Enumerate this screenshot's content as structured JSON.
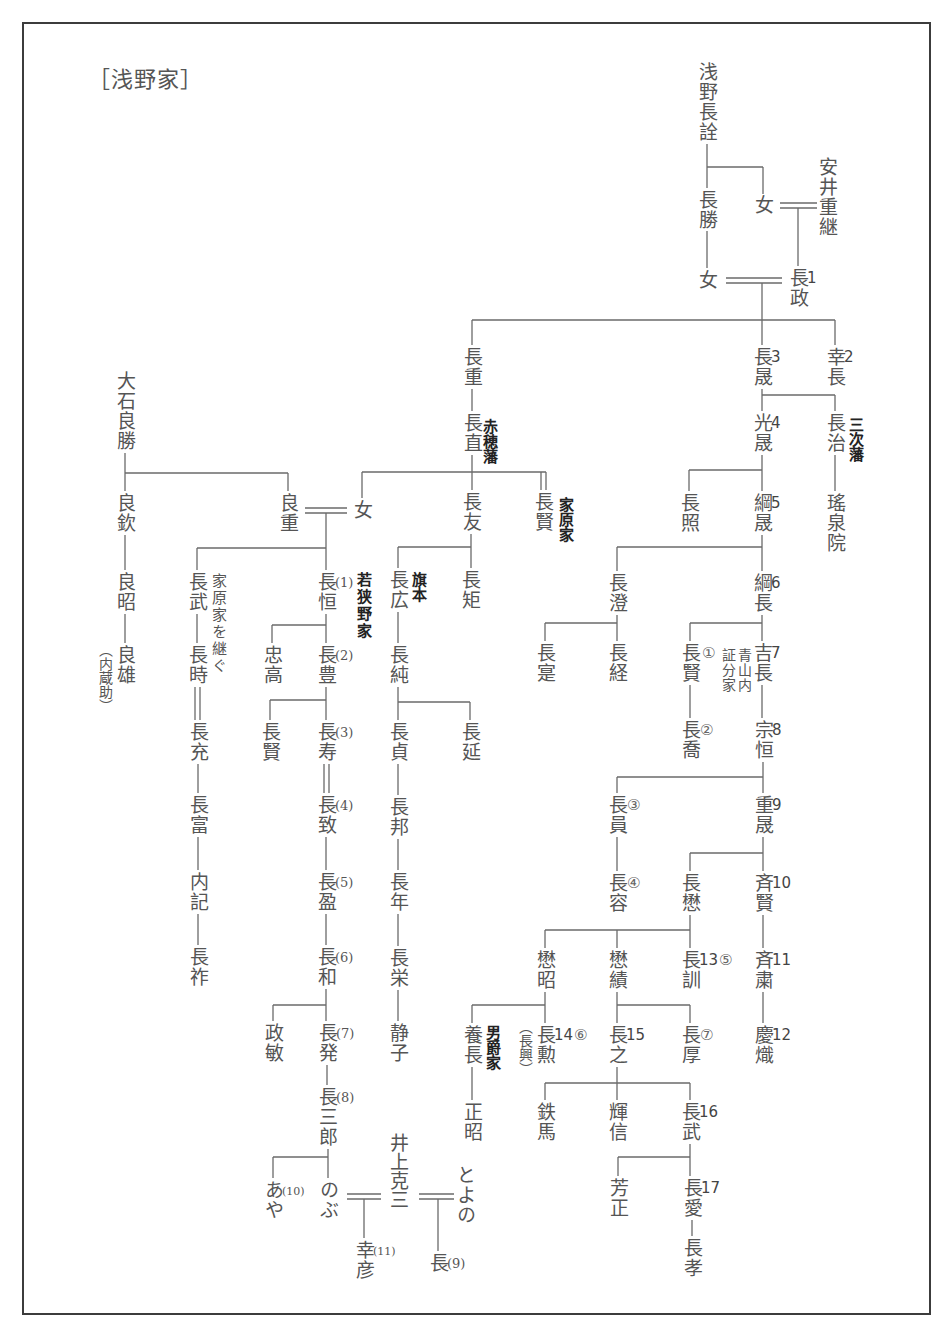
{
  "title": "［浅野家］",
  "persons": {
    "p01": {
      "name": "浅野長詮"
    },
    "p02": {
      "name": "長勝"
    },
    "p03": {
      "name": "女"
    },
    "p04": {
      "name": "安井重継"
    },
    "p05": {
      "name": "女"
    },
    "p06": {
      "name": "長政",
      "gen": "1"
    },
    "p07": {
      "name": "長晟",
      "gen": "3"
    },
    "p08": {
      "name": "幸長",
      "gen": "2"
    },
    "p09": {
      "name": "長重"
    },
    "p10": {
      "name": "長直",
      "note": "赤穂藩"
    },
    "p11": {
      "name": "光晟",
      "gen": "4"
    },
    "p12": {
      "name": "長治",
      "note": "三次藩"
    },
    "p13": {
      "name": "瑤泉院"
    },
    "p14": {
      "name": "長照"
    },
    "p15": {
      "name": "綱晟",
      "gen": "5"
    },
    "p16": {
      "name": "長澄"
    },
    "p17": {
      "name": "綱長",
      "gen": "6"
    },
    "p18": {
      "name": "長寔"
    },
    "p19": {
      "name": "長経"
    },
    "p20": {
      "name": "長賢",
      "branch": "①",
      "note": "青山内証分家"
    },
    "p21": {
      "name": "吉長",
      "gen": "7"
    },
    "p22": {
      "name": "長喬",
      "branch": "②"
    },
    "p23": {
      "name": "宗恒",
      "gen": "8"
    },
    "p24": {
      "name": "長員",
      "branch": "③"
    },
    "p25": {
      "name": "重晟",
      "gen": "9"
    },
    "p26": {
      "name": "長容",
      "branch": "④"
    },
    "p27": {
      "name": "長懋"
    },
    "p28": {
      "name": "斉賢",
      "gen": "10"
    },
    "p29": {
      "name": "懋昭"
    },
    "p30": {
      "name": "懋績"
    },
    "p31": {
      "name": "長訓",
      "gen": "13",
      "branch": "⑤"
    },
    "p32": {
      "name": "斉粛",
      "gen": "11"
    },
    "p33": {
      "name": "養長",
      "note": "男爵家"
    },
    "p34": {
      "name": "長勲",
      "gen": "14",
      "branch": "⑥",
      "alias": "（長興）"
    },
    "p35": {
      "name": "長之",
      "gen": "15"
    },
    "p36": {
      "name": "長厚",
      "branch": "⑦"
    },
    "p37": {
      "name": "慶熾",
      "gen": "12"
    },
    "p38": {
      "name": "正昭"
    },
    "p39": {
      "name": "鉄馬"
    },
    "p40": {
      "name": "輝信"
    },
    "p41": {
      "name": "長武",
      "gen": "16"
    },
    "p42": {
      "name": "芳正"
    },
    "p43": {
      "name": "長愛",
      "gen": "17"
    },
    "p44": {
      "name": "長孝"
    },
    "p45": {
      "name": "女"
    },
    "p46": {
      "name": "長友"
    },
    "p47": {
      "name": "長賢",
      "note": "家原家"
    },
    "p48": {
      "name": "長広",
      "note": "旗本"
    },
    "p49": {
      "name": "長矩"
    },
    "p50": {
      "name": "長純"
    },
    "p51": {
      "name": "長貞"
    },
    "p52": {
      "name": "長延"
    },
    "p53": {
      "name": "長邦"
    },
    "p54": {
      "name": "長年"
    },
    "p55": {
      "name": "長栄"
    },
    "p56": {
      "name": "静子"
    },
    "p57": {
      "name": "大石良勝"
    },
    "p58": {
      "name": "良欽"
    },
    "p59": {
      "name": "良重"
    },
    "p60": {
      "name": "良昭"
    },
    "p61": {
      "name": "良雄",
      "alias": "（内蔵助）"
    },
    "p62": {
      "name": "長武",
      "note": "家原家を継ぐ"
    },
    "p63": {
      "name": "長恒",
      "branch": "(1)",
      "note": "若狭野家"
    },
    "p64": {
      "name": "長時"
    },
    "p65": {
      "name": "忠高"
    },
    "p66": {
      "name": "長豊",
      "branch": "(2)"
    },
    "p67": {
      "name": "長充"
    },
    "p68": {
      "name": "長賢"
    },
    "p69": {
      "name": "長寿",
      "branch": "(3)"
    },
    "p70": {
      "name": "長富"
    },
    "p71": {
      "name": "長致",
      "branch": "(4)"
    },
    "p72": {
      "name": "内記"
    },
    "p73": {
      "name": "長盈",
      "branch": "(5)"
    },
    "p74": {
      "name": "長祚"
    },
    "p75": {
      "name": "長和",
      "branch": "(6)"
    },
    "p76": {
      "name": "政敏"
    },
    "p77": {
      "name": "長発",
      "branch": "(7)"
    },
    "p78": {
      "name": "長三郎",
      "branch": "(8)"
    },
    "p79": {
      "name": "あや",
      "branch": "(10)"
    },
    "p80": {
      "name": "のぶ"
    },
    "p81": {
      "name": "井上克三"
    },
    "p82": {
      "name": "幸彦",
      "branch": "(11)"
    },
    "p83": {
      "name": "とよの"
    },
    "p84": {
      "name": "長",
      "branch": "(9)"
    }
  },
  "relations": {
    "marriages": [
      {
        "pair": [
          "p03",
          "p04"
        ],
        "children": [
          "p06"
        ]
      },
      {
        "pair": [
          "p05",
          "p06"
        ],
        "children": [
          "p09",
          "p07",
          "p08"
        ]
      },
      {
        "pair": [
          "p59",
          "p45"
        ],
        "children": [
          "p62",
          "p63"
        ]
      },
      {
        "pair": [
          "p80",
          "p81"
        ],
        "children": [
          "p82"
        ]
      },
      {
        "pair": [
          "p81",
          "p83"
        ],
        "children": [
          "p84"
        ]
      }
    ],
    "adoptions": [
      [
        "p10",
        "p47"
      ],
      [
        "p64",
        "p67"
      ],
      [
        "p69",
        "p71"
      ]
    ],
    "children": {
      "p01": [
        "p02",
        "p03"
      ],
      "p02": [
        "p05"
      ],
      "p09": [
        "p10"
      ],
      "p10": [
        "p45",
        "p46"
      ],
      "p07": [
        "p11",
        "p12"
      ],
      "p12": [
        "p13"
      ],
      "p11": [
        "p14",
        "p15"
      ],
      "p15": [
        "p16",
        "p17"
      ],
      "p16": [
        "p18",
        "p19"
      ],
      "p17": [
        "p20",
        "p21"
      ],
      "p20": [
        "p22"
      ],
      "p21": [
        "p23"
      ],
      "p23": [
        "p24",
        "p25"
      ],
      "p24": [
        "p26"
      ],
      "p25": [
        "p27",
        "p28"
      ],
      "p27": [
        "p29",
        "p30",
        "p31"
      ],
      "p28": [
        "p32"
      ],
      "p32": [
        "p37"
      ],
      "p29": [
        "p33",
        "p34"
      ],
      "p30": [
        "p35",
        "p36"
      ],
      "p33": [
        "p38"
      ],
      "p35": [
        "p39",
        "p40",
        "p41"
      ],
      "p41": [
        "p42",
        "p43"
      ],
      "p43": [
        "p44"
      ],
      "p46": [
        "p48",
        "p49"
      ],
      "p48": [
        "p50"
      ],
      "p50": [
        "p51",
        "p52"
      ],
      "p51": [
        "p53"
      ],
      "p53": [
        "p54"
      ],
      "p54": [
        "p55"
      ],
      "p55": [
        "p56"
      ],
      "p57": [
        "p58",
        "p59"
      ],
      "p58": [
        "p60"
      ],
      "p60": [
        "p61"
      ],
      "p62": [
        "p64"
      ],
      "p67": [
        "p70"
      ],
      "p70": [
        "p72"
      ],
      "p72": [
        "p74"
      ],
      "p63": [
        "p65",
        "p66"
      ],
      "p66": [
        "p68",
        "p69"
      ],
      "p71": [
        "p73"
      ],
      "p73": [
        "p75"
      ],
      "p75": [
        "p76",
        "p77"
      ],
      "p77": [
        "p78"
      ],
      "p78": [
        "p79",
        "p80"
      ]
    }
  },
  "colors": {
    "text": "#555555",
    "note": "#222222",
    "line": "#6a6a6a",
    "frame": "#3c3c3c"
  }
}
